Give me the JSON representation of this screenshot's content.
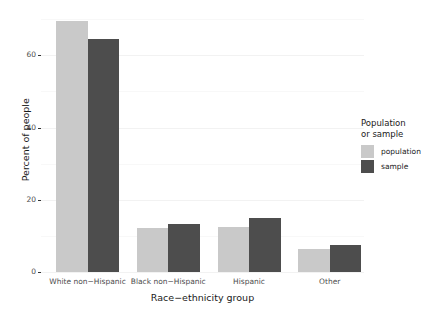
{
  "chart_data": {
    "type": "bar",
    "title": "",
    "subtitle": "",
    "xlabel": "Race−ethnicity group",
    "ylabel": "Percent of people",
    "categories": [
      "White non−Hispanic",
      "Black non−Hispanic",
      "Hispanic",
      "Other"
    ],
    "series": [
      {
        "name": "population",
        "color": "#c9c9c9",
        "values": [
          69.5,
          12.3,
          12.5,
          6.3
        ]
      },
      {
        "name": "sample",
        "color": "#4d4d4d",
        "values": [
          64.5,
          13.3,
          15.0,
          7.5
        ]
      }
    ],
    "ylim": [
      0,
      72
    ],
    "y_ticks": [
      0,
      20,
      40,
      60
    ],
    "y_tick_labels": [
      "0",
      "20",
      "40",
      "60"
    ],
    "y_minor_ticks": [
      10,
      30,
      50,
      70
    ],
    "grid": true,
    "grid_axis": "y",
    "legend": {
      "title": "Population\nor sample",
      "position": "right",
      "entries": [
        {
          "label": "population",
          "color": "#c9c9c9"
        },
        {
          "label": "sample",
          "color": "#4d4d4d"
        }
      ]
    },
    "bar_layout": "grouped",
    "background": "#ffffff"
  }
}
